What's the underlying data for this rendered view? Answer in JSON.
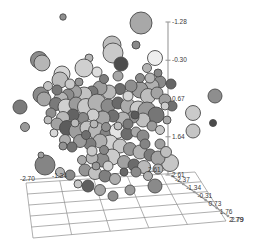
{
  "chart_data": {
    "type": "scatter",
    "title": "",
    "subtitle": "",
    "projection": "3d",
    "marker": "bubble",
    "grid": true,
    "legend": null,
    "xlabel": "",
    "ylabel": "",
    "zlabel": "",
    "axes": {
      "x": {
        "name": "x-axis",
        "ticks": [
          -2.7,
          -1.34,
          0.02,
          1.38,
          2.61
        ],
        "ticklabels": [
          "-2.70",
          "-1.34",
          "0.02",
          "1.38",
          "2.61"
        ],
        "visible_ticklabels": [
          "-2.70",
          "-1.34",
          "2.61"
        ],
        "lim": [
          -2.7,
          2.61
        ]
      },
      "y": {
        "name": "y-axis-depth",
        "ticks": [
          -2.37,
          -1.34,
          -0.31,
          0.73,
          1.76,
          2.79
        ],
        "ticklabels": [
          "-2.37",
          "-1.34",
          "-0.31",
          "0.73",
          "1.76",
          "2.79"
        ],
        "visible_ticklabels": [
          "-1.34",
          "-0.31",
          "0.73",
          "1.76",
          "2.79"
        ],
        "lim": [
          -2.37,
          2.79
        ]
      },
      "z": {
        "name": "z-axis-vertical",
        "ticks": [
          -1.28,
          -0.3,
          0.67,
          1.64,
          2.61
        ],
        "ticklabels": [
          "-1.28",
          "-0.30",
          "0.67",
          "1.64",
          "2.61"
        ],
        "lim": [
          -1.28,
          2.61
        ]
      }
    },
    "colormap": "grayscale",
    "point_count": 140,
    "points": [
      {
        "cx": 63,
        "cy": 17,
        "r": 3.2,
        "fill": "#8f8f8f"
      },
      {
        "cx": 141,
        "cy": 23,
        "r": 11.0,
        "fill": "#a8a8a8"
      },
      {
        "cx": 112,
        "cy": 45,
        "r": 9.0,
        "fill": "#bdbdbd"
      },
      {
        "cx": 136,
        "cy": 45,
        "r": 4.0,
        "fill": "#8a8a8a"
      },
      {
        "cx": 113,
        "cy": 53,
        "r": 10.0,
        "fill": "#c9c9c9"
      },
      {
        "cx": 155,
        "cy": 58,
        "r": 7.5,
        "fill": "#eeeeee"
      },
      {
        "cx": 39,
        "cy": 60,
        "r": 8.5,
        "fill": "#8d8d8d"
      },
      {
        "cx": 42,
        "cy": 63,
        "r": 8.0,
        "fill": "#b6b6b6"
      },
      {
        "cx": 121,
        "cy": 64,
        "r": 7.0,
        "fill": "#4d4d4d"
      },
      {
        "cx": 89,
        "cy": 58,
        "r": 4.0,
        "fill": "#b4b4b4"
      },
      {
        "cx": 84,
        "cy": 68,
        "r": 9.0,
        "fill": "#cfcfcf"
      },
      {
        "cx": 62,
        "cy": 74,
        "r": 8.0,
        "fill": "#d6d6d6"
      },
      {
        "cx": 60,
        "cy": 80,
        "r": 8.0,
        "fill": "#bcbcbc"
      },
      {
        "cx": 97,
        "cy": 72,
        "r": 5.0,
        "fill": "#dddddd"
      },
      {
        "cx": 41,
        "cy": 95,
        "r": 8.0,
        "fill": "#8b8b8b"
      },
      {
        "cx": 44,
        "cy": 99,
        "r": 7.0,
        "fill": "#a5a5a5"
      },
      {
        "cx": 20,
        "cy": 107,
        "r": 7.0,
        "fill": "#7b7b7b"
      },
      {
        "cx": 25,
        "cy": 127,
        "r": 4.5,
        "fill": "#9a9a9a"
      },
      {
        "cx": 215,
        "cy": 96,
        "r": 7.0,
        "fill": "#8e8e8e"
      },
      {
        "cx": 193,
        "cy": 113,
        "r": 7.5,
        "fill": "#cacaca"
      },
      {
        "cx": 213,
        "cy": 123,
        "r": 3.5,
        "fill": "#4a4a4a"
      },
      {
        "cx": 193,
        "cy": 131,
        "r": 7.0,
        "fill": "#c5c5c5"
      },
      {
        "cx": 170,
        "cy": 163,
        "r": 8.5,
        "fill": "#c6c6c6"
      },
      {
        "cx": 45,
        "cy": 165,
        "r": 10.0,
        "fill": "#858585"
      },
      {
        "cx": 41,
        "cy": 155,
        "r": 3.0,
        "fill": "#9f9f9f"
      },
      {
        "cx": 160,
        "cy": 82,
        "r": 6.0,
        "fill": "#8a8a8a"
      },
      {
        "cx": 171,
        "cy": 84,
        "r": 5.0,
        "fill": "#666666"
      },
      {
        "cx": 152,
        "cy": 86,
        "r": 7.0,
        "fill": "#b0b0b0"
      },
      {
        "cx": 140,
        "cy": 90,
        "r": 8.0,
        "fill": "#9c9c9c"
      },
      {
        "cx": 148,
        "cy": 96,
        "r": 7.5,
        "fill": "#bebebe"
      },
      {
        "cx": 157,
        "cy": 93,
        "r": 6.0,
        "fill": "#a3a3a3"
      },
      {
        "cx": 131,
        "cy": 86,
        "r": 6.0,
        "fill": "#8f8f8f"
      },
      {
        "cx": 120,
        "cy": 89,
        "r": 5.5,
        "fill": "#6e6e6e"
      },
      {
        "cx": 109,
        "cy": 92,
        "r": 7.0,
        "fill": "#b8b8b8"
      },
      {
        "cx": 100,
        "cy": 88,
        "r": 7.0,
        "fill": "#9d9d9d"
      },
      {
        "cx": 92,
        "cy": 92,
        "r": 6.0,
        "fill": "#777777"
      },
      {
        "cx": 84,
        "cy": 95,
        "r": 8.0,
        "fill": "#c2c2c2"
      },
      {
        "cx": 75,
        "cy": 92,
        "r": 6.5,
        "fill": "#a0a0a0"
      },
      {
        "cx": 68,
        "cy": 95,
        "r": 6.0,
        "fill": "#8c8c8c"
      },
      {
        "cx": 61,
        "cy": 99,
        "r": 7.0,
        "fill": "#b5b5b5"
      },
      {
        "cx": 56,
        "cy": 104,
        "r": 6.5,
        "fill": "#7a7a7a"
      },
      {
        "cx": 66,
        "cy": 107,
        "r": 8.0,
        "fill": "#d0d0d0"
      },
      {
        "cx": 76,
        "cy": 104,
        "r": 7.0,
        "fill": "#9b9b9b"
      },
      {
        "cx": 86,
        "cy": 107,
        "r": 8.5,
        "fill": "#c8c8c8"
      },
      {
        "cx": 97,
        "cy": 103,
        "r": 9.0,
        "fill": "#b1b1b1"
      },
      {
        "cx": 108,
        "cy": 106,
        "r": 7.0,
        "fill": "#8b8b8b"
      },
      {
        "cx": 118,
        "cy": 103,
        "r": 6.0,
        "fill": "#6a6a6a"
      },
      {
        "cx": 128,
        "cy": 106,
        "r": 7.5,
        "fill": "#ababab"
      },
      {
        "cx": 138,
        "cy": 109,
        "r": 8.0,
        "fill": "#cacaca"
      },
      {
        "cx": 147,
        "cy": 111,
        "r": 9.0,
        "fill": "#999999"
      },
      {
        "cx": 156,
        "cy": 115,
        "r": 8.0,
        "fill": "#767676"
      },
      {
        "cx": 143,
        "cy": 120,
        "r": 7.0,
        "fill": "#c0c0c0"
      },
      {
        "cx": 133,
        "cy": 117,
        "r": 6.0,
        "fill": "#8e8e8e"
      },
      {
        "cx": 123,
        "cy": 119,
        "r": 7.0,
        "fill": "#b3b3b3"
      },
      {
        "cx": 113,
        "cy": 116,
        "r": 6.0,
        "fill": "#707070"
      },
      {
        "cx": 103,
        "cy": 118,
        "r": 7.0,
        "fill": "#a7a7a7"
      },
      {
        "cx": 93,
        "cy": 115,
        "r": 6.0,
        "fill": "#cdcdcd"
      },
      {
        "cx": 83,
        "cy": 118,
        "r": 5.5,
        "fill": "#888888"
      },
      {
        "cx": 73,
        "cy": 115,
        "r": 6.0,
        "fill": "#636363"
      },
      {
        "cx": 63,
        "cy": 118,
        "r": 6.5,
        "fill": "#b9b9b9"
      },
      {
        "cx": 57,
        "cy": 124,
        "r": 6.0,
        "fill": "#a2a2a2"
      },
      {
        "cx": 67,
        "cy": 128,
        "r": 7.5,
        "fill": "#5c5c5c"
      },
      {
        "cx": 77,
        "cy": 131,
        "r": 8.0,
        "fill": "#9e9e9e"
      },
      {
        "cx": 87,
        "cy": 128,
        "r": 7.0,
        "fill": "#c4c4c4"
      },
      {
        "cx": 97,
        "cy": 131,
        "r": 8.5,
        "fill": "#b7b7b7"
      },
      {
        "cx": 107,
        "cy": 134,
        "r": 7.0,
        "fill": "#858585"
      },
      {
        "cx": 117,
        "cy": 131,
        "r": 7.5,
        "fill": "#e4e4e4"
      },
      {
        "cx": 127,
        "cy": 134,
        "r": 6.0,
        "fill": "#6d6d6d"
      },
      {
        "cx": 136,
        "cy": 132,
        "r": 5.0,
        "fill": "#a9a9a9"
      },
      {
        "cx": 143,
        "cy": 136,
        "r": 6.0,
        "fill": "#8a8a8a"
      },
      {
        "cx": 110,
        "cy": 143,
        "r": 8.0,
        "fill": "#d2d2d2"
      },
      {
        "cx": 100,
        "cy": 141,
        "r": 7.0,
        "fill": "#afafaf"
      },
      {
        "cx": 90,
        "cy": 144,
        "r": 6.0,
        "fill": "#7e7e7e"
      },
      {
        "cx": 80,
        "cy": 141,
        "r": 6.5,
        "fill": "#9a9a9a"
      },
      {
        "cx": 120,
        "cy": 146,
        "r": 7.0,
        "fill": "#c7c7c7"
      },
      {
        "cx": 130,
        "cy": 149,
        "r": 6.5,
        "fill": "#969696"
      },
      {
        "cx": 140,
        "cy": 152,
        "r": 7.0,
        "fill": "#b2b2b2"
      },
      {
        "cx": 150,
        "cy": 155,
        "r": 6.0,
        "fill": "#7c7c7c"
      },
      {
        "cx": 158,
        "cy": 158,
        "r": 7.0,
        "fill": "#a4a4a4"
      },
      {
        "cx": 112,
        "cy": 157,
        "r": 8.0,
        "fill": "#cbcbcb"
      },
      {
        "cx": 102,
        "cy": 160,
        "r": 7.0,
        "fill": "#8d8d8d"
      },
      {
        "cx": 92,
        "cy": 158,
        "r": 6.0,
        "fill": "#b6b6b6"
      },
      {
        "cx": 124,
        "cy": 162,
        "r": 6.5,
        "fill": "#a1a1a1"
      },
      {
        "cx": 134,
        "cy": 165,
        "r": 6.0,
        "fill": "#6b6b6b"
      },
      {
        "cx": 144,
        "cy": 167,
        "r": 6.5,
        "fill": "#bababa"
      },
      {
        "cx": 85,
        "cy": 170,
        "r": 6.0,
        "fill": "#949494"
      },
      {
        "cx": 95,
        "cy": 173,
        "r": 6.5,
        "fill": "#c1c1c1"
      },
      {
        "cx": 105,
        "cy": 176,
        "r": 6.0,
        "fill": "#7f7f7f"
      },
      {
        "cx": 115,
        "cy": 179,
        "r": 5.5,
        "fill": "#aeaeae"
      },
      {
        "cx": 70,
        "cy": 175,
        "r": 5.0,
        "fill": "#8a8a8a"
      },
      {
        "cx": 60,
        "cy": 172,
        "r": 4.5,
        "fill": "#b4b4b4"
      },
      {
        "cx": 88,
        "cy": 186,
        "r": 6.0,
        "fill": "#5f5f5f"
      },
      {
        "cx": 100,
        "cy": 190,
        "r": 5.5,
        "fill": "#a6a6a6"
      },
      {
        "cx": 113,
        "cy": 196,
        "r": 5.0,
        "fill": "#8e8e8e"
      },
      {
        "cx": 130,
        "cy": 190,
        "r": 5.0,
        "fill": "#9c9c9c"
      },
      {
        "cx": 155,
        "cy": 186,
        "r": 7.0,
        "fill": "#8a8a8a"
      },
      {
        "cx": 78,
        "cy": 184,
        "r": 4.0,
        "fill": "#c8c8c8"
      },
      {
        "cx": 57,
        "cy": 90,
        "r": 5.0,
        "fill": "#787878"
      },
      {
        "cx": 48,
        "cy": 86,
        "r": 4.5,
        "fill": "#c3c3c3"
      },
      {
        "cx": 165,
        "cy": 100,
        "r": 6.0,
        "fill": "#9f9f9f"
      },
      {
        "cx": 172,
        "cy": 106,
        "r": 5.0,
        "fill": "#707070"
      },
      {
        "cx": 150,
        "cy": 78,
        "r": 5.0,
        "fill": "#b8b8b8"
      },
      {
        "cx": 140,
        "cy": 78,
        "r": 4.5,
        "fill": "#8c8c8c"
      },
      {
        "cx": 128,
        "cy": 96,
        "r": 5.0,
        "fill": "#d4d4d4"
      },
      {
        "cx": 118,
        "cy": 76,
        "r": 5.0,
        "fill": "#a7a7a7"
      },
      {
        "cx": 104,
        "cy": 79,
        "r": 4.5,
        "fill": "#7d7d7d"
      },
      {
        "cx": 70,
        "cy": 84,
        "r": 5.0,
        "fill": "#cacaca"
      },
      {
        "cx": 79,
        "cy": 82,
        "r": 4.0,
        "fill": "#969696"
      },
      {
        "cx": 51,
        "cy": 113,
        "r": 5.0,
        "fill": "#8f8f8f"
      },
      {
        "cx": 48,
        "cy": 120,
        "r": 4.0,
        "fill": "#bcbcbc"
      },
      {
        "cx": 152,
        "cy": 126,
        "r": 5.0,
        "fill": "#9b9b9b"
      },
      {
        "cx": 160,
        "cy": 130,
        "r": 4.5,
        "fill": "#c6c6c6"
      },
      {
        "cx": 145,
        "cy": 144,
        "r": 5.0,
        "fill": "#848484"
      },
      {
        "cx": 65,
        "cy": 140,
        "r": 5.5,
        "fill": "#adadad"
      },
      {
        "cx": 72,
        "cy": 147,
        "r": 5.0,
        "fill": "#737373"
      },
      {
        "cx": 54,
        "cy": 133,
        "r": 4.0,
        "fill": "#d8d8d8"
      },
      {
        "cx": 160,
        "cy": 144,
        "r": 5.0,
        "fill": "#a0a0a0"
      },
      {
        "cx": 166,
        "cy": 152,
        "r": 5.5,
        "fill": "#bfbfbf"
      },
      {
        "cx": 136,
        "cy": 172,
        "r": 5.0,
        "fill": "#8b8b8b"
      },
      {
        "cx": 148,
        "cy": 176,
        "r": 4.5,
        "fill": "#b0b0b0"
      },
      {
        "cx": 124,
        "cy": 172,
        "r": 4.0,
        "fill": "#686868"
      },
      {
        "cx": 108,
        "cy": 166,
        "r": 5.0,
        "fill": "#d1d1d1"
      },
      {
        "cx": 96,
        "cy": 166,
        "r": 4.0,
        "fill": "#999999"
      },
      {
        "cx": 82,
        "cy": 160,
        "r": 4.5,
        "fill": "#aaaaaa"
      },
      {
        "cx": 128,
        "cy": 124,
        "r": 5.0,
        "fill": "#7a7a7a"
      },
      {
        "cx": 118,
        "cy": 126,
        "r": 4.0,
        "fill": "#c0c0c0"
      },
      {
        "cx": 106,
        "cy": 127,
        "r": 4.5,
        "fill": "#909090"
      },
      {
        "cx": 94,
        "cy": 124,
        "r": 4.0,
        "fill": "#b7b7b7"
      },
      {
        "cx": 86,
        "cy": 135,
        "r": 4.5,
        "fill": "#6f6f6f"
      },
      {
        "cx": 165,
        "cy": 106,
        "r": 4.0,
        "fill": "#cdcdcd"
      },
      {
        "cx": 158,
        "cy": 73,
        "r": 4.0,
        "fill": "#898989"
      },
      {
        "cx": 147,
        "cy": 68,
        "r": 4.5,
        "fill": "#b3b3b3"
      },
      {
        "cx": 135,
        "cy": 115,
        "r": 4.0,
        "fill": "#5a5a5a"
      },
      {
        "cx": 167,
        "cy": 120,
        "r": 4.0,
        "fill": "#a8a8a8"
      },
      {
        "cx": 75,
        "cy": 123,
        "r": 4.0,
        "fill": "#bbbbbb"
      },
      {
        "cx": 63,
        "cy": 146,
        "r": 4.0,
        "fill": "#939393"
      },
      {
        "cx": 92,
        "cy": 151,
        "r": 5.0,
        "fill": "#c9c9c9"
      },
      {
        "cx": 104,
        "cy": 150,
        "r": 4.5,
        "fill": "#868686"
      },
      {
        "cx": 158,
        "cy": 169,
        "r": 5.0,
        "fill": "#b5b5b5"
      }
    ]
  },
  "style": {
    "background": "#ffffff",
    "axis_color": "#9a9a9a",
    "grid_color": "#8c8c8c",
    "label_color": "#3a3a3a",
    "bubble_stroke": "#4a4a4a"
  }
}
